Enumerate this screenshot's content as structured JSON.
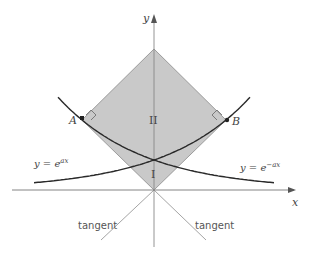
{
  "figure": {
    "axes": {
      "x_label": "x",
      "y_label": "y"
    },
    "curves": [
      {
        "name": "exp-plus",
        "equation_prefix": "y = e",
        "exponent": "ax"
      },
      {
        "name": "exp-minus",
        "equation_prefix": "y = e",
        "exponent": "−ax"
      }
    ],
    "points": [
      {
        "label": "A"
      },
      {
        "label": "B"
      }
    ],
    "regions": [
      {
        "label": "II"
      },
      {
        "label": "I"
      }
    ],
    "tangent_labels": [
      "tangent",
      "tangent"
    ],
    "colors": {
      "shaded_region": "#c8c8c8",
      "curve": "#2a2a2a",
      "axis": "#777777",
      "tangent_line": "#999999"
    }
  }
}
